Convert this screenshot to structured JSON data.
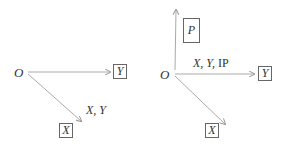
{
  "diagrams": [
    {
      "origin": "O",
      "boxes": {
        "y": "Y",
        "x": "X"
      },
      "edge_label": "X, Y"
    },
    {
      "origin": "O",
      "boxes": {
        "p": "P",
        "y": "Y",
        "x": "X"
      },
      "edge_label_italic": "X, Y,",
      "edge_label_roman": "IP"
    }
  ],
  "colors": {
    "arrow": "#aaaaaa",
    "box_border": "#666666",
    "text": "#333333"
  }
}
